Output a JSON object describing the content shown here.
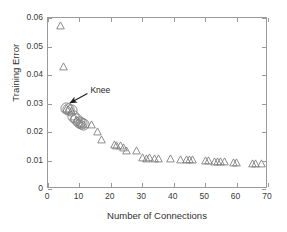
{
  "figure": {
    "background_color": "#ffffff",
    "axis_color": "#9a9a9a",
    "marker_color": "#7a7a7a",
    "annotation_color": "#1d1d1d"
  },
  "chart_data": {
    "type": "scatter",
    "title": "",
    "xlabel": "Number of Connections",
    "ylabel": "Training Error",
    "xlim": [
      0,
      70
    ],
    "ylim": [
      0,
      0.06
    ],
    "xticks": [
      0,
      10,
      20,
      30,
      40,
      50,
      60,
      70
    ],
    "xticklabels": [
      "0",
      "10",
      "20",
      "30",
      "40",
      "50",
      "60",
      "70"
    ],
    "yticks": [
      0,
      0.01,
      0.02,
      0.03,
      0.04,
      0.05,
      0.06
    ],
    "yticklabels": [
      "0",
      "0.01",
      "0.02",
      "0.03",
      "0.04",
      "0.05",
      "0.06"
    ],
    "grid": false,
    "legend": false,
    "marker_style": "triangle-up-open",
    "series": [
      {
        "name": "Training Error vs Connections",
        "points": [
          [
            4,
            0.0572
          ],
          [
            5,
            0.043
          ],
          [
            6,
            0.0283
          ],
          [
            6.6,
            0.0279
          ],
          [
            7.4,
            0.0276
          ],
          [
            8.2,
            0.0253
          ],
          [
            9,
            0.0243
          ],
          [
            10,
            0.0233
          ],
          [
            10.7,
            0.0229
          ],
          [
            11.3,
            0.0228
          ],
          [
            13.8,
            0.0227
          ],
          [
            15.8,
            0.0203
          ],
          [
            17,
            0.0173
          ],
          [
            21,
            0.0155
          ],
          [
            21.8,
            0.0154
          ],
          [
            23,
            0.0153
          ],
          [
            24,
            0.0146
          ],
          [
            25,
            0.0136
          ],
          [
            28,
            0.0136
          ],
          [
            30.2,
            0.011
          ],
          [
            31.2,
            0.0108
          ],
          [
            32.4,
            0.0109
          ],
          [
            34,
            0.0108
          ],
          [
            35,
            0.0108
          ],
          [
            39,
            0.0107
          ],
          [
            42,
            0.0104
          ],
          [
            44,
            0.0103
          ],
          [
            45,
            0.0103
          ],
          [
            46,
            0.0102
          ],
          [
            50,
            0.0101
          ],
          [
            51,
            0.01
          ],
          [
            53,
            0.0098
          ],
          [
            54,
            0.0098
          ],
          [
            55,
            0.0097
          ],
          [
            56,
            0.0097
          ],
          [
            59,
            0.0094
          ],
          [
            60,
            0.0093
          ],
          [
            65,
            0.0091
          ],
          [
            66,
            0.0091
          ],
          [
            68,
            0.0091
          ]
        ]
      }
    ],
    "highlighted_points": [
      [
        6,
        0.0283
      ],
      [
        6.6,
        0.0279
      ],
      [
        7.4,
        0.0276
      ],
      [
        8.2,
        0.0253
      ],
      [
        9,
        0.0243
      ],
      [
        10,
        0.0233
      ],
      [
        10.7,
        0.0229
      ],
      [
        11.3,
        0.0228
      ]
    ],
    "annotations": [
      {
        "label": "Knee",
        "text_x": 13.5,
        "text_y": 0.0335,
        "arrow_tip_x": 7.0,
        "arrow_tip_y": 0.0295
      }
    ]
  }
}
